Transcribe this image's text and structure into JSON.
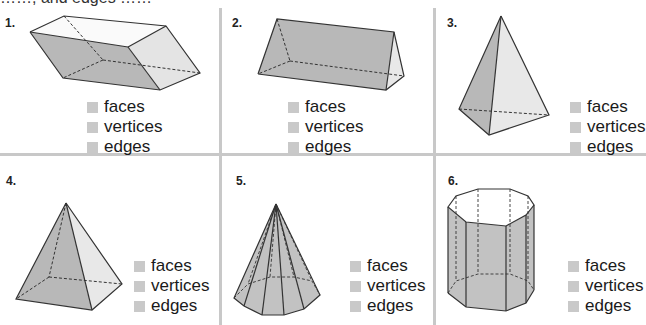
{
  "header": {
    "partial_text": "……, and edges ……"
  },
  "colors": {
    "divider": "#c8c8c8",
    "face_dark": "#b5b5b5",
    "face_light": "#e6e6e6",
    "checkbox": "#c9c9c9",
    "edge": "#333333"
  },
  "legend_labels": [
    "faces",
    "vertices",
    "edges"
  ],
  "problems": [
    {
      "number": "1.",
      "shape": "rectangular prism (parallelepiped)",
      "labels": [
        "faces",
        "vertices",
        "edges"
      ]
    },
    {
      "number": "2.",
      "shape": "triangular prism",
      "labels": [
        "faces",
        "vertices",
        "edges"
      ]
    },
    {
      "number": "3.",
      "shape": "triangular pyramid",
      "labels": [
        "faces",
        "vertices",
        "edges"
      ]
    },
    {
      "number": "4.",
      "shape": "square pyramid",
      "labels": [
        "faces",
        "vertices",
        "edges"
      ]
    },
    {
      "number": "5.",
      "shape": "octagonal pyramid",
      "labels": [
        "faces",
        "vertices",
        "edges"
      ]
    },
    {
      "number": "6.",
      "shape": "octagonal prism",
      "labels": [
        "faces",
        "vertices",
        "edges"
      ]
    }
  ]
}
